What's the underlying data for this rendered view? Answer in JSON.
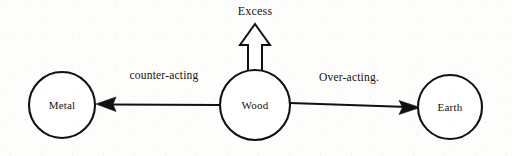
{
  "diagram": {
    "type": "five-element-relationship-diagram",
    "background_color": "#fdfdfc",
    "stroke_color": "#111111",
    "nodes": [
      {
        "id": "metal",
        "label": "Metal",
        "cx": 62,
        "cy": 105,
        "r": 33
      },
      {
        "id": "wood",
        "label": "Wood",
        "cx": 255,
        "cy": 105,
        "r": 35
      },
      {
        "id": "earth",
        "label": "Earth",
        "cx": 450,
        "cy": 107,
        "r": 32
      }
    ],
    "edges": [
      {
        "id": "wood-to-metal",
        "label": "counter-acting",
        "from": "wood",
        "to": "metal",
        "direction": "left",
        "arrowhead": "solid",
        "label_x": 164,
        "label_y": 75
      },
      {
        "id": "wood-to-earth",
        "label": "Over-acting.",
        "from": "wood",
        "to": "earth",
        "direction": "right",
        "arrowhead": "solid",
        "label_x": 349,
        "label_y": 77
      }
    ],
    "excess_arrow": {
      "label": "Excess",
      "direction": "up",
      "style": "hollow-outline",
      "label_x": 255,
      "label_y": 11
    }
  }
}
